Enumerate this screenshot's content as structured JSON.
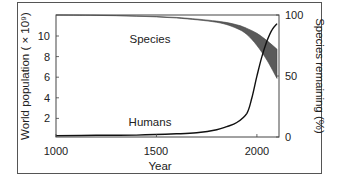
{
  "chart_data": {
    "type": "line",
    "title": "",
    "xlabel": "Year",
    "ylabel": "World population ( × 10⁹)",
    "y2label": "Species remaining (%)",
    "xlim": [
      1000,
      2110
    ],
    "ylim": [
      0,
      12
    ],
    "y2lim": [
      0,
      100
    ],
    "xticks": [
      "1000",
      "1500",
      "2000"
    ],
    "yticks": [
      "2",
      "4",
      "6",
      "8",
      "10"
    ],
    "y2ticks": [
      "0",
      "50",
      "100"
    ],
    "grid": false,
    "legend": "none",
    "annotations": [
      "Species",
      "Humans"
    ],
    "series": [
      {
        "name": "Humans",
        "axis": "left",
        "x": [
          1000,
          1200,
          1400,
          1600,
          1700,
          1800,
          1850,
          1900,
          1950,
          1975,
          2000,
          2025,
          2050,
          2075,
          2100
        ],
        "values": [
          0.31,
          0.36,
          0.38,
          0.5,
          0.6,
          0.9,
          1.2,
          1.6,
          2.5,
          4.0,
          6.1,
          8.0,
          9.5,
          10.6,
          11.2
        ]
      },
      {
        "name": "Species (upper bound)",
        "axis": "right",
        "x": [
          1000,
          1200,
          1400,
          1600,
          1800,
          1900,
          1950,
          2000,
          2050,
          2100
        ],
        "values": [
          100,
          99.8,
          99.2,
          98,
          95,
          92,
          89,
          85,
          79,
          72
        ]
      },
      {
        "name": "Species (lower bound)",
        "axis": "right",
        "x": [
          1000,
          1200,
          1400,
          1600,
          1800,
          1900,
          1950,
          2000,
          2050,
          2100
        ],
        "values": [
          100,
          99.7,
          99,
          97.5,
          94,
          89,
          84,
          75,
          63,
          48
        ]
      }
    ]
  }
}
